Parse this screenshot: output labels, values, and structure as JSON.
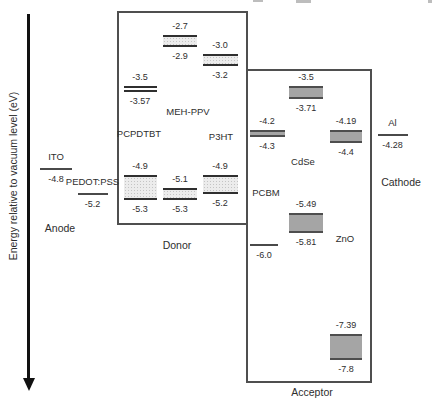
{
  "figure": {
    "axis_label": "Energy relative to vacuum level (eV)",
    "unit": "eV"
  },
  "groups": {
    "anode": {
      "label": "Anode"
    },
    "donor": {
      "label": "Donor"
    },
    "acceptor": {
      "label": "Acceptor"
    },
    "cathode": {
      "label": "Cathode"
    }
  },
  "colors": {
    "ink": "#2e2e2e",
    "arrow": "#111111",
    "box_border": "#4f4f4f",
    "level_line": "#4a4a4a",
    "band_dotted_fill": "#ececec",
    "band_dotted_dot": "#c4c4c4",
    "band_dotted_border": "#2f2f2f",
    "band_solid_fill": "#a5a5a5",
    "band_solid_border": "#4e4e4e"
  },
  "chart_data": {
    "type": "energy-level-diagram",
    "ylabel": "Energy relative to vacuum level (eV)",
    "ylim": [
      -8.2,
      -2.4
    ],
    "axis_style": "vertical-arrow-pointing-down",
    "grid": false,
    "columns": [
      {
        "id": "ito",
        "group": "anode",
        "name": "ITO",
        "levels": [
          {
            "kind": "line",
            "label": "-4.8",
            "ev": -4.8
          }
        ]
      },
      {
        "id": "pedot-pss",
        "group": "anode",
        "name": "PEDOT:PSS",
        "levels": [
          {
            "kind": "line",
            "label": "-5.2",
            "ev": -5.2
          }
        ]
      },
      {
        "id": "pcpdtbt",
        "group": "donor",
        "name": "PCPDTBT",
        "levels": [
          {
            "kind": "double-line",
            "top": "-3.5",
            "bottom": "-3.57"
          },
          {
            "kind": "band",
            "style": "dotted",
            "top": "-4.9",
            "bottom": "-5.3"
          }
        ]
      },
      {
        "id": "meh-ppv",
        "group": "donor",
        "name": "MEH-PPV",
        "levels": [
          {
            "kind": "band",
            "style": "dotted",
            "top": "-2.7",
            "bottom": "-2.9"
          },
          {
            "kind": "band",
            "style": "dotted",
            "top": "-5.1",
            "bottom": "-5.3"
          }
        ]
      },
      {
        "id": "p3ht",
        "group": "donor",
        "name": "P3HT",
        "levels": [
          {
            "kind": "band",
            "style": "dotted",
            "top": "-3.0",
            "bottom": "-3.2"
          },
          {
            "kind": "band",
            "style": "dotted",
            "top": "-4.9",
            "bottom": "-5.2"
          }
        ]
      },
      {
        "id": "pcbm",
        "group": "acceptor",
        "name": "PCBM",
        "levels": [
          {
            "kind": "band",
            "style": "solid",
            "top": "-4.2",
            "bottom": "-4.3"
          },
          {
            "kind": "line",
            "label": "-6.0",
            "ev": -6.0
          }
        ]
      },
      {
        "id": "cdse",
        "group": "acceptor",
        "name": "CdSe",
        "levels": [
          {
            "kind": "band",
            "style": "solid",
            "top": "-3.5",
            "bottom": "-3.71"
          },
          {
            "kind": "band",
            "style": "solid",
            "top": "-5.49",
            "bottom": "-5.81"
          }
        ]
      },
      {
        "id": "zno",
        "group": "acceptor",
        "name": "ZnO",
        "levels": [
          {
            "kind": "band",
            "style": "solid",
            "top": "-4.19",
            "bottom": "-4.4"
          },
          {
            "kind": "band",
            "style": "solid",
            "top": "-7.39",
            "bottom": "-7.8"
          }
        ]
      },
      {
        "id": "al",
        "group": "cathode",
        "name": "Al",
        "levels": [
          {
            "kind": "line",
            "label": "-4.28",
            "ev": -4.28
          }
        ]
      }
    ]
  }
}
